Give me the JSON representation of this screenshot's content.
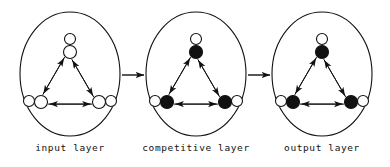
{
  "figure": {
    "type": "neural-network-layer-diagram",
    "background_color": "#ffffff",
    "stroke_color": "#111111",
    "canvas": {
      "width": 390,
      "height": 167
    }
  },
  "layers": [
    {
      "id": "input-layer",
      "label": "input layer",
      "label_x": 70,
      "label_y": 151,
      "ellipse": {
        "cx": 70,
        "cy": 74,
        "rx": 50,
        "ry": 62
      },
      "node_fill": "#ffffff",
      "node_stroke": "#111111",
      "nodes": [
        {
          "id": "top",
          "cx": 70,
          "cy": 52,
          "r": 6.5,
          "loop_cx": 70,
          "loop_cy": 39,
          "loop_r": 5.5
        },
        {
          "id": "bottom-left",
          "cx": 41,
          "cy": 102,
          "r": 6.5,
          "loop_cx": 29,
          "loop_cy": 101,
          "loop_r": 5.5
        },
        {
          "id": "bottom-right",
          "cx": 99,
          "cy": 102,
          "r": 6.5,
          "loop_cx": 111,
          "loop_cy": 101,
          "loop_r": 5.5
        }
      ]
    },
    {
      "id": "competitive-layer",
      "label": "competitive layer",
      "label_x": 196,
      "label_y": 151,
      "ellipse": {
        "cx": 196,
        "cy": 74,
        "rx": 50,
        "ry": 62
      },
      "node_fill": "#111111",
      "node_stroke": "#111111",
      "nodes": [
        {
          "id": "top",
          "cx": 196,
          "cy": 52,
          "r": 6.5,
          "loop_cx": 196,
          "loop_cy": 39,
          "loop_r": 5.5
        },
        {
          "id": "bottom-left",
          "cx": 167,
          "cy": 102,
          "r": 6.5,
          "loop_cx": 155,
          "loop_cy": 101,
          "loop_r": 5.5
        },
        {
          "id": "bottom-right",
          "cx": 225,
          "cy": 102,
          "r": 6.5,
          "loop_cx": 237,
          "loop_cy": 101,
          "loop_r": 5.5
        }
      ]
    },
    {
      "id": "output-layer",
      "label": "output layer",
      "label_x": 322,
      "label_y": 151,
      "ellipse": {
        "cx": 322,
        "cy": 74,
        "rx": 50,
        "ry": 62
      },
      "node_fill": "#111111",
      "node_stroke": "#111111",
      "nodes": [
        {
          "id": "top",
          "cx": 322,
          "cy": 52,
          "r": 6.5,
          "loop_cx": 322,
          "loop_cy": 39,
          "loop_r": 5.5
        },
        {
          "id": "bottom-left",
          "cx": 293,
          "cy": 102,
          "r": 6.5,
          "loop_cx": 281,
          "loop_cy": 101,
          "loop_r": 5.5
        },
        {
          "id": "bottom-right",
          "cx": 351,
          "cy": 102,
          "r": 6.5,
          "loop_cx": 363,
          "loop_cy": 101,
          "loop_r": 5.5
        }
      ]
    }
  ],
  "connectors": [
    {
      "id": "input-to-competitive",
      "x1": 122,
      "y1": 75,
      "x2": 144,
      "y2": 75
    },
    {
      "id": "competitive-to-output",
      "x1": 248,
      "y1": 75,
      "x2": 270,
      "y2": 75
    }
  ],
  "edges_per_layer": [
    {
      "from": "top",
      "to": "bottom-left",
      "bidirectional": true
    },
    {
      "from": "top",
      "to": "bottom-right",
      "bidirectional": true
    },
    {
      "from": "bottom-left",
      "to": "bottom-right",
      "bidirectional": true
    }
  ]
}
